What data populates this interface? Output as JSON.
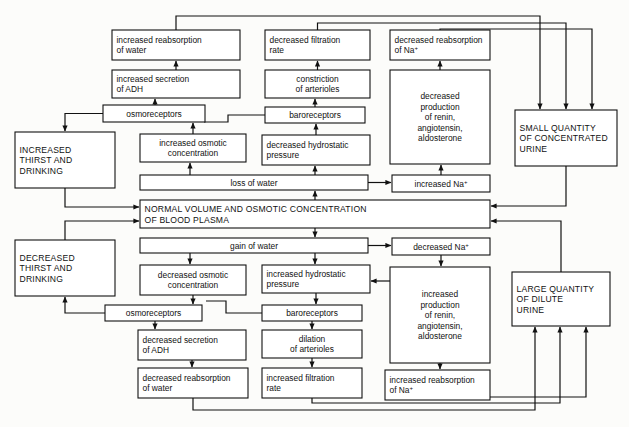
{
  "diagram": {
    "colors": {
      "stroke": "#111111",
      "box_fill": "#ffffff",
      "background": "#fcfcfa"
    },
    "center": {
      "label_line1": "NORMAL VOLUME AND OSMOTIC CONCENTRATION",
      "label_line2": "OF BLOOD PLASMA"
    },
    "boxes": [
      {
        "id": "increased-reabsorption-water",
        "lines": [
          "increased reabsorption",
          "of water"
        ],
        "x": 112,
        "y": 30,
        "w": 128,
        "h": 30,
        "style": "normal"
      },
      {
        "id": "decreased-filtration-rate",
        "lines": [
          "decreased filtration",
          "rate"
        ],
        "x": 265,
        "y": 30,
        "w": 105,
        "h": 30,
        "style": "normal"
      },
      {
        "id": "decreased-reabsorption-na",
        "lines": [
          "decreased reabsorption",
          "of Na+"
        ],
        "x": 390,
        "y": 30,
        "w": 100,
        "h": 30,
        "style": "normal"
      },
      {
        "id": "increased-secretion-adh",
        "lines": [
          "increased secretion",
          "of ADH"
        ],
        "x": 112,
        "y": 70,
        "w": 128,
        "h": 28,
        "style": "normal"
      },
      {
        "id": "constriction-arterioles",
        "lines": [
          "constriction",
          "of arterioles"
        ],
        "x": 265,
        "y": 70,
        "w": 105,
        "h": 28,
        "style": "center"
      },
      {
        "id": "decreased-production-renin",
        "lines": [
          "decreased",
          "production",
          "of renin,",
          "angiotensin,",
          "aldosterone"
        ],
        "x": 390,
        "y": 70,
        "w": 100,
        "h": 94,
        "style": "center"
      },
      {
        "id": "osmoreceptors-top",
        "lines": [
          "osmoreceptors"
        ],
        "x": 103,
        "y": 105,
        "w": 102,
        "h": 17,
        "style": "center"
      },
      {
        "id": "baroreceptors-top",
        "lines": [
          "baroreceptors"
        ],
        "x": 265,
        "y": 107,
        "w": 100,
        "h": 16,
        "style": "center"
      },
      {
        "id": "small-quantity-urine",
        "lines": [
          "SMALL QUANTITY",
          "OF CONCENTRATED",
          "URINE"
        ],
        "x": 515,
        "y": 110,
        "w": 102,
        "h": 56,
        "style": "caps"
      },
      {
        "id": "increased-thirst-drinking",
        "lines": [
          "INCREASED",
          "THIRST AND",
          "DRINKING"
        ],
        "x": 15,
        "y": 132,
        "w": 100,
        "h": 56,
        "style": "caps"
      },
      {
        "id": "increased-osmotic-concentration",
        "lines": [
          "increased  osmotic",
          "concentration"
        ],
        "x": 140,
        "y": 134,
        "w": 106,
        "h": 28,
        "style": "center"
      },
      {
        "id": "decreased-hydrostatic-pressure",
        "lines": [
          "decreased  hydrostatic",
          "pressure"
        ],
        "x": 262,
        "y": 135,
        "w": 108,
        "h": 30,
        "style": "normal"
      },
      {
        "id": "loss-of-water",
        "lines": [
          "loss of water"
        ],
        "x": 140,
        "y": 175,
        "w": 228,
        "h": 15,
        "style": "center"
      },
      {
        "id": "increased-na",
        "lines": [
          "increased Na+"
        ],
        "x": 392,
        "y": 175,
        "w": 98,
        "h": 17,
        "style": "center"
      },
      {
        "id": "normal-volume-plasma",
        "lines": [
          "NORMAL VOLUME AND OSMOTIC CONCENTRATION",
          "OF BLOOD PLASMA"
        ],
        "x": 140,
        "y": 200,
        "w": 350,
        "h": 28,
        "style": "caps"
      },
      {
        "id": "gain-of-water",
        "lines": [
          "gain of water"
        ],
        "x": 140,
        "y": 238,
        "w": 228,
        "h": 15,
        "style": "center"
      },
      {
        "id": "decreased-na",
        "lines": [
          "decreased Na+"
        ],
        "x": 392,
        "y": 238,
        "w": 98,
        "h": 17,
        "style": "center"
      },
      {
        "id": "decreased-thirst-drinking",
        "lines": [
          "DECREASED",
          "THIRST AND",
          "DRINKING"
        ],
        "x": 15,
        "y": 240,
        "w": 100,
        "h": 56,
        "style": "caps"
      },
      {
        "id": "decreased-osmotic-concentration",
        "lines": [
          "decreased osmotic",
          "concentration"
        ],
        "x": 140,
        "y": 265,
        "w": 106,
        "h": 30,
        "style": "center"
      },
      {
        "id": "increased-hydrostatic-pressure",
        "lines": [
          "increased hydrostatic",
          "pressure"
        ],
        "x": 262,
        "y": 265,
        "w": 108,
        "h": 28,
        "style": "normal"
      },
      {
        "id": "increased-production-renin",
        "lines": [
          "increased",
          "production",
          "of renin,",
          "angiotensin,",
          "aldosterone"
        ],
        "x": 390,
        "y": 267,
        "w": 100,
        "h": 96,
        "style": "center"
      },
      {
        "id": "large-quantity-urine",
        "lines": [
          "LARGE QUANTITY",
          "OF DILUTE",
          "URINE"
        ],
        "x": 512,
        "y": 272,
        "w": 98,
        "h": 54,
        "style": "caps"
      },
      {
        "id": "osmoreceptors-bottom",
        "lines": [
          "osmoreceptors"
        ],
        "x": 105,
        "y": 305,
        "w": 97,
        "h": 16,
        "style": "center"
      },
      {
        "id": "baroreceptors-bottom",
        "lines": [
          "baroreceptors"
        ],
        "x": 262,
        "y": 305,
        "w": 100,
        "h": 16,
        "style": "center"
      },
      {
        "id": "decreased-secretion-adh",
        "lines": [
          "decreased secretion",
          "of ADH"
        ],
        "x": 138,
        "y": 330,
        "w": 108,
        "h": 30,
        "style": "normal"
      },
      {
        "id": "dilation-arterioles",
        "lines": [
          "dilation",
          "of arterioles"
        ],
        "x": 262,
        "y": 330,
        "w": 100,
        "h": 28,
        "style": "center"
      },
      {
        "id": "decreased-reabsorption-water",
        "lines": [
          "decreased reabsorption",
          "of water"
        ],
        "x": 138,
        "y": 368,
        "w": 110,
        "h": 30,
        "style": "normal"
      },
      {
        "id": "increased-filtration-rate",
        "lines": [
          "increased filtration",
          "rate"
        ],
        "x": 262,
        "y": 368,
        "w": 100,
        "h": 30,
        "style": "normal"
      },
      {
        "id": "increased-reabsorption-na",
        "lines": [
          "increased reabsorption",
          "of Na+"
        ],
        "x": 385,
        "y": 370,
        "w": 105,
        "h": 30,
        "style": "normal"
      }
    ],
    "flows": [
      {
        "from": "normal-volume-plasma",
        "to": "loss-of-water",
        "label": "loss of water"
      },
      {
        "from": "loss-of-water",
        "to": "increased-osmotic-concentration",
        "label": ""
      },
      {
        "from": "loss-of-water",
        "to": "decreased-hydrostatic-pressure",
        "label": ""
      },
      {
        "from": "loss-of-water",
        "to": "increased-na",
        "label": ""
      },
      {
        "from": "increased-osmotic-concentration",
        "to": "osmoreceptors-top",
        "label": ""
      },
      {
        "from": "osmoreceptors-top",
        "to": "increased-secretion-adh",
        "label": ""
      },
      {
        "from": "osmoreceptors-top",
        "to": "increased-thirst-drinking",
        "label": ""
      },
      {
        "from": "increased-secretion-adh",
        "to": "increased-reabsorption-water",
        "label": ""
      },
      {
        "from": "decreased-hydrostatic-pressure",
        "to": "baroreceptors-top",
        "label": ""
      },
      {
        "from": "baroreceptors-top",
        "to": "constriction-arterioles",
        "label": ""
      },
      {
        "from": "baroreceptors-top",
        "to": "osmoreceptors-top",
        "label": ""
      },
      {
        "from": "constriction-arterioles",
        "to": "decreased-filtration-rate",
        "label": ""
      },
      {
        "from": "increased-na",
        "to": "decreased-production-renin",
        "label": ""
      },
      {
        "from": "decreased-production-renin",
        "to": "decreased-reabsorption-na",
        "label": ""
      },
      {
        "from": "increased-reabsorption-water",
        "to": "small-quantity-urine",
        "label": ""
      },
      {
        "from": "decreased-filtration-rate",
        "to": "small-quantity-urine",
        "label": ""
      },
      {
        "from": "decreased-reabsorption-na",
        "to": "small-quantity-urine",
        "label": ""
      },
      {
        "from": "small-quantity-urine",
        "to": "normal-volume-plasma",
        "label": ""
      },
      {
        "from": "increased-thirst-drinking",
        "to": "normal-volume-plasma",
        "label": ""
      },
      {
        "from": "normal-volume-plasma",
        "to": "gain-of-water",
        "label": "gain of water"
      },
      {
        "from": "gain-of-water",
        "to": "decreased-osmotic-concentration",
        "label": ""
      },
      {
        "from": "gain-of-water",
        "to": "increased-hydrostatic-pressure",
        "label": ""
      },
      {
        "from": "gain-of-water",
        "to": "decreased-na",
        "label": ""
      },
      {
        "from": "decreased-osmotic-concentration",
        "to": "osmoreceptors-bottom",
        "label": ""
      },
      {
        "from": "osmoreceptors-bottom",
        "to": "decreased-secretion-adh",
        "label": ""
      },
      {
        "from": "osmoreceptors-bottom",
        "to": "decreased-thirst-drinking",
        "label": ""
      },
      {
        "from": "decreased-secretion-adh",
        "to": "decreased-reabsorption-water",
        "label": ""
      },
      {
        "from": "increased-hydrostatic-pressure",
        "to": "baroreceptors-bottom",
        "label": ""
      },
      {
        "from": "baroreceptors-bottom",
        "to": "dilation-arterioles",
        "label": ""
      },
      {
        "from": "baroreceptors-bottom",
        "to": "osmoreceptors-bottom",
        "label": ""
      },
      {
        "from": "dilation-arterioles",
        "to": "increased-filtration-rate",
        "label": ""
      },
      {
        "from": "decreased-na",
        "to": "increased-production-renin",
        "label": ""
      },
      {
        "from": "increased-production-renin",
        "to": "increased-reabsorption-na",
        "label": ""
      },
      {
        "from": "increased-production-renin",
        "to": "increased-hydrostatic-pressure",
        "label": ""
      },
      {
        "from": "decreased-reabsorption-water",
        "to": "large-quantity-urine",
        "label": ""
      },
      {
        "from": "increased-filtration-rate",
        "to": "large-quantity-urine",
        "label": ""
      },
      {
        "from": "increased-reabsorption-na",
        "to": "large-quantity-urine",
        "label": ""
      },
      {
        "from": "large-quantity-urine",
        "to": "normal-volume-plasma",
        "label": ""
      },
      {
        "from": "decreased-thirst-drinking",
        "to": "normal-volume-plasma",
        "label": ""
      }
    ]
  }
}
